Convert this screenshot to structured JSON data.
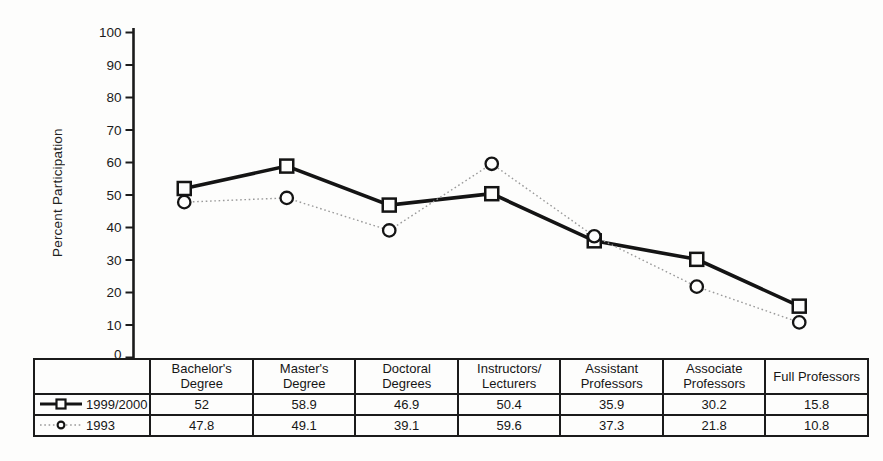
{
  "figure_background": "#fdfdfc",
  "colors": {
    "ink": "#1b1b1b",
    "solid_line": "#141414",
    "dotted_line": "#9a9a9a"
  },
  "chart_data": {
    "type": "line",
    "title": "",
    "xlabel": "",
    "ylabel": "Percent Participation",
    "ylim": [
      0,
      100
    ],
    "yticks": [
      0,
      10,
      20,
      30,
      40,
      50,
      60,
      70,
      80,
      90,
      100
    ],
    "grid": false,
    "legend_position": "table-rows-left",
    "categories": [
      "Bachelor's\nDegree",
      "Master's\nDegree",
      "Doctoral\nDegrees",
      "Instructors/\nLecturers",
      "Assistant\nProfessors",
      "Associate\nProfessors",
      "Full Professors"
    ],
    "series": [
      {
        "name": "1999/2000",
        "marker": "square",
        "line_style": "solid",
        "values": [
          52,
          58.9,
          46.9,
          50.4,
          35.9,
          30.2,
          15.8
        ]
      },
      {
        "name": "1993",
        "marker": "circle",
        "line_style": "dotted",
        "values": [
          47.8,
          49.1,
          39.1,
          59.6,
          37.3,
          21.8,
          10.8
        ]
      }
    ]
  }
}
